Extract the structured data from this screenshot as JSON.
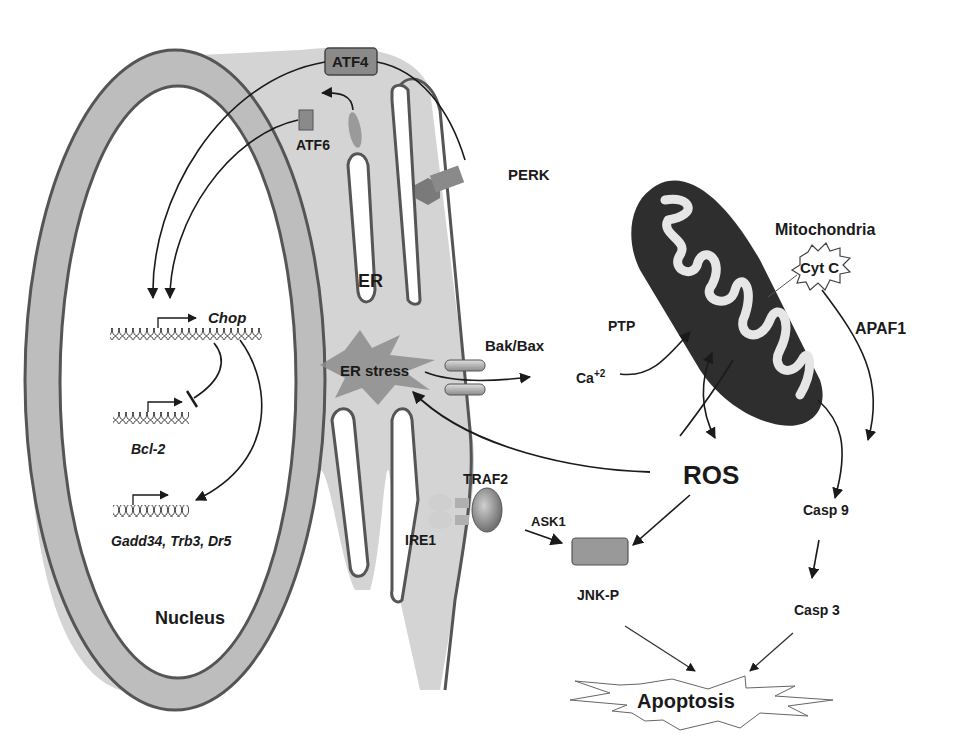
{
  "diagram": {
    "type": "signaling-pathway",
    "title": "",
    "compartments": {
      "nucleus": "Nucleus",
      "er": "ER",
      "mitochondria": "Mitochondria"
    },
    "proteins": {
      "atf4": "ATF4",
      "atf6": "ATF6",
      "perk": "PERK",
      "ire1": "IRE1",
      "traf2": "TRAF2",
      "ask1": "ASK1",
      "jnk": "JNK-P",
      "bak_bax": "Bak/Bax",
      "ptp": "PTP",
      "cyt_c": "Cyt C",
      "apaf1": "APAF1",
      "casp9": "Casp 9",
      "casp3": "Casp 3"
    },
    "genes": {
      "chop": "Chop",
      "bcl2": "Bcl-2",
      "targets": "Gadd34, Trb3, Dr5"
    },
    "events": {
      "er_stress": "ER stress",
      "ros": "ROS",
      "calcium": "Ca",
      "calcium_sup": "+2",
      "apoptosis": "Apoptosis"
    },
    "edges": [
      {
        "from": "PERK",
        "to": "ATF4",
        "type": "activation"
      },
      {
        "from": "ATF4",
        "to": "Chop",
        "type": "activation"
      },
      {
        "from": "ATF6 (ER)",
        "to": "ATF6 (cleaved)",
        "type": "activation"
      },
      {
        "from": "ATF6",
        "to": "Chop",
        "type": "activation"
      },
      {
        "from": "Chop",
        "to": "Bcl-2",
        "type": "inhibition"
      },
      {
        "from": "Chop",
        "to": "Gadd34, Trb3, Dr5",
        "type": "activation"
      },
      {
        "from": "ER stress",
        "to": "Bak/Bax",
        "type": "activation"
      },
      {
        "from": "Ca+2",
        "to": "PTP",
        "type": "activation"
      },
      {
        "from": "Mitochondria",
        "to": "ROS",
        "type": "activation"
      },
      {
        "from": "ROS",
        "to": "Mitochondria",
        "type": "activation"
      },
      {
        "from": "ROS",
        "to": "ER stress",
        "type": "activation"
      },
      {
        "from": "ROS",
        "to": "JNK-P",
        "type": "activation"
      },
      {
        "from": "ASK1",
        "to": "JNK-P",
        "type": "activation"
      },
      {
        "from": "Cyt C",
        "to": "Casp 9",
        "type": "activation"
      },
      {
        "from": "APAF1",
        "to": "Casp 9",
        "type": "activation"
      },
      {
        "from": "Casp 9",
        "to": "Casp 3",
        "type": "activation"
      },
      {
        "from": "JNK-P",
        "to": "Apoptosis",
        "type": "activation"
      },
      {
        "from": "Casp 3",
        "to": "Apoptosis",
        "type": "activation"
      }
    ]
  },
  "colors": {
    "membrane_fill": "#c8c8c8",
    "membrane_stroke": "#5a5a5a",
    "er_fill": "#d2d2d2",
    "mito_fill": "#2e2e2e",
    "protein_fill": "#8a8a8a",
    "stress_fill": "#8c8c8c"
  }
}
